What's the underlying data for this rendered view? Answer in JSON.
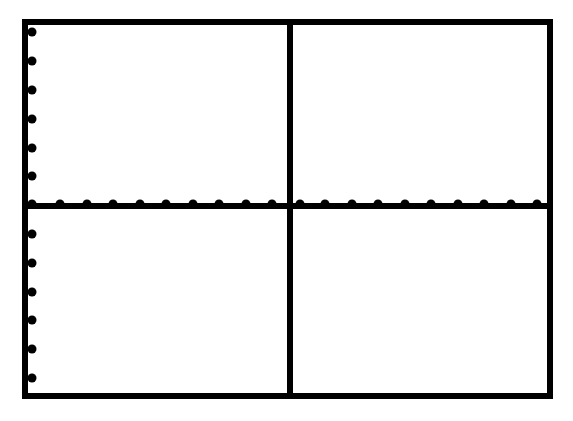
{
  "figure": {
    "type": "blank-coordinate-grid",
    "colors": {
      "background": "#ffffff",
      "stroke": "#000000"
    },
    "frame": {
      "left": 25,
      "top": 22,
      "right": 550,
      "bottom": 396,
      "stroke_width": 6
    },
    "x_axis": {
      "y": 206,
      "stroke_width": 6
    },
    "y_divider": {
      "x": 290,
      "stroke_width": 6
    },
    "x_ticks": [
      32,
      60,
      87,
      113,
      140,
      166,
      193,
      219,
      246,
      272,
      300,
      325,
      352,
      378,
      405,
      431,
      458,
      484,
      511,
      537
    ],
    "y_ticks_left": [
      32,
      61,
      90,
      119,
      148,
      176,
      234,
      263,
      292,
      320,
      349,
      378
    ],
    "tick_radius": 4.5
  }
}
